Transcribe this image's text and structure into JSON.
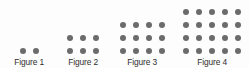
{
  "canvas": {
    "width": 249,
    "height": 68,
    "background_color": "#fdfdfd"
  },
  "style": {
    "dot_color": "#6b6b6b",
    "label_color": "#2e2e2e",
    "dot_diameter_px": 6,
    "dot_pitch_x_px": 13,
    "dot_pitch_y_px": 13,
    "label_font_size_px": 9
  },
  "chart_data": {
    "type": "scatter",
    "title": "",
    "xlabel": "",
    "ylabel": "",
    "categories": [
      "Figure 1",
      "Figure 2",
      "Figure 3",
      "Figure 4"
    ],
    "values": [
      2,
      6,
      12,
      20
    ],
    "series": [
      {
        "name": "columns",
        "values": [
          2,
          3,
          4,
          5
        ]
      },
      {
        "name": "rows",
        "values": [
          1,
          2,
          3,
          4
        ]
      },
      {
        "name": "total dots",
        "values": [
          2,
          6,
          12,
          20
        ]
      }
    ],
    "rule": "dots(n) = n x (n + 1)",
    "legend": "none",
    "grid": false
  },
  "figures": [
    {
      "label": "Figure 1",
      "columns": 2,
      "rows": 1,
      "dot_count": 2,
      "left_px": 3,
      "group_width_px": 52
    },
    {
      "label": "Figure 2",
      "columns": 3,
      "rows": 2,
      "dot_count": 6,
      "left_px": 57,
      "group_width_px": 52
    },
    {
      "label": "Figure 3",
      "columns": 4,
      "rows": 3,
      "dot_count": 12,
      "left_px": 113,
      "group_width_px": 58
    },
    {
      "label": "Figure 4",
      "columns": 5,
      "rows": 4,
      "dot_count": 20,
      "left_px": 177,
      "group_width_px": 70
    }
  ]
}
